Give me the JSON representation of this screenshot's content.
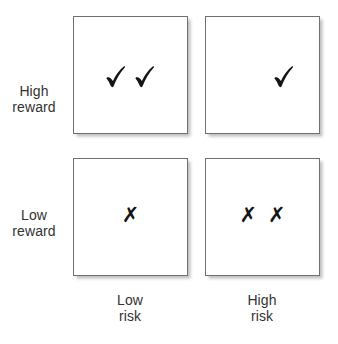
{
  "figure": {
    "background_color": "#ffffff",
    "text_color": "#333333",
    "border_color": "#6f7073",
    "mark_color": "#141414"
  },
  "axes": {
    "row_labels": [
      {
        "id": "high-reward",
        "line1": "High",
        "line2": "reward"
      },
      {
        "id": "low-reward",
        "line1": "Low",
        "line2": "reward"
      }
    ],
    "column_labels": [
      {
        "id": "low-risk",
        "line1": "Low",
        "line2": "risk"
      },
      {
        "id": "high-risk",
        "line1": "High",
        "line2": "risk"
      }
    ]
  },
  "cells": [
    {
      "id": "high-reward-low-risk",
      "row": "High reward",
      "column": "Low risk",
      "mark_type": "check",
      "mark_count": 2,
      "mark_glyph": "check-mark-icon"
    },
    {
      "id": "high-reward-high-risk",
      "row": "High reward",
      "column": "High risk",
      "mark_type": "check",
      "mark_count": 1,
      "mark_glyph": "check-mark-icon"
    },
    {
      "id": "low-reward-low-risk",
      "row": "Low reward",
      "column": "Low risk",
      "mark_type": "cross",
      "mark_count": 1,
      "mark_glyph": "✗"
    },
    {
      "id": "low-reward-high-risk",
      "row": "Low reward",
      "column": "High risk",
      "mark_type": "cross",
      "mark_count": 2,
      "mark_glyph": "✗"
    }
  ]
}
